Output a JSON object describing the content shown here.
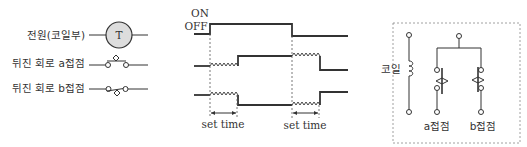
{
  "legend": {
    "rows": [
      {
        "label": "전원(코일부)",
        "symbol": "timer-coil",
        "coil_letter": "T"
      },
      {
        "label": "뒤진 회로 a접점",
        "symbol": "delay-a-contact"
      },
      {
        "label": "뒤진 회로 b접점",
        "symbol": "delay-b-contact"
      }
    ]
  },
  "timing": {
    "on_label": "ON",
    "off_label": "OFF",
    "set_time_labels": [
      "set time",
      "set time"
    ],
    "signals": [
      {
        "name": "power",
        "states": "OFF→ON→OFF"
      },
      {
        "name": "a-contact",
        "states": "OFF→(delay)→ON→(delay)→OFF"
      },
      {
        "name": "b-contact",
        "states": "ON→(delay)→OFF→(delay)→ON"
      }
    ]
  },
  "schematic": {
    "coil_label": "코일",
    "a_contact_label": "a접점",
    "b_contact_label": "b접점"
  },
  "colors": {
    "line": "#333333",
    "coil_fill": "#dddddd",
    "box_border": "#888888"
  }
}
